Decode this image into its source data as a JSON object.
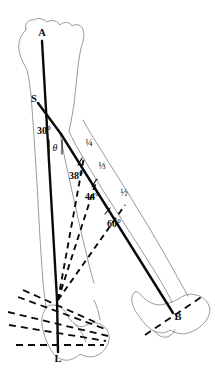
{
  "figure": {
    "background_color": "#ffffff",
    "outline_color": "#8e8e8e",
    "line_color": "#0a0a0a",
    "width": 215,
    "height": 372
  },
  "points": [
    {
      "id": "A",
      "label": "A",
      "x": 42,
      "y": 36,
      "role": "proximal-axis-endpoint"
    },
    {
      "id": "S",
      "label": "S",
      "x": 37,
      "y": 99,
      "role": "mid-shaft-marker"
    },
    {
      "id": "B",
      "label": "B",
      "x": 176,
      "y": 316,
      "role": "distal-endpoint-second-limb"
    },
    {
      "id": "L",
      "label": "L",
      "x": 58,
      "y": 358,
      "role": "distal-axis-endpoint"
    }
  ],
  "angles": [
    {
      "id": "a30",
      "label": "30°",
      "value": 30,
      "x": 45,
      "y": 132,
      "role": "axis-divergence-angle"
    },
    {
      "id": "theta",
      "label": "θ",
      "value": null,
      "x": 52,
      "y": 148,
      "role": "variable-angle"
    },
    {
      "id": "a38",
      "label": "38°",
      "value": 38,
      "x": 75,
      "y": 176,
      "role": "ray-angle-quarter"
    },
    {
      "id": "a44",
      "label": "44°",
      "value": 44,
      "x": 91,
      "y": 194,
      "role": "ray-angle-third"
    },
    {
      "id": "a60",
      "label": "60°",
      "value": 60,
      "x": 112,
      "y": 222,
      "role": "ray-angle-half"
    }
  ],
  "fractions": [
    {
      "id": "f14",
      "label": "¼",
      "value": 0.25,
      "x": 88,
      "y": 142,
      "role": "division-point-one-quarter"
    },
    {
      "id": "f13",
      "label": "⅓",
      "value": 0.3333,
      "x": 101,
      "y": 165,
      "role": "division-point-one-third"
    },
    {
      "id": "f12",
      "label": "½",
      "value": 0.5,
      "x": 122,
      "y": 192,
      "role": "division-point-one-half"
    }
  ],
  "geometry": {
    "axis_main": {
      "from": [
        42,
        40
      ],
      "to": [
        58,
        300
      ],
      "description": "A to ankle axis"
    },
    "axis_lower": {
      "from": [
        58,
        300
      ],
      "to": [
        58,
        352
      ],
      "description": "ankle to L"
    },
    "segment_s": {
      "from": [
        38,
        103
      ],
      "to": [
        60,
        133
      ],
      "description": "S branch to knee notch"
    },
    "diagonal_main": {
      "from": [
        60,
        133
      ],
      "to": [
        172,
        312
      ],
      "description": "knee to B diagonal"
    },
    "rays": [
      {
        "id": "ray-38",
        "from": [
          58,
          300
        ],
        "to": [
          85,
          156
        ],
        "angle": 38
      },
      {
        "id": "ray-44",
        "from": [
          58,
          300
        ],
        "to": [
          97,
          178
        ],
        "angle": 44
      },
      {
        "id": "ray-60",
        "from": [
          58,
          300
        ],
        "to": [
          124,
          204
        ],
        "angle": 60
      }
    ],
    "fan_lines": 4
  },
  "icons": {
    "femur": "femur-bone-outline",
    "tibia": "tibia-bone-outline",
    "foot": "foot-outline"
  }
}
